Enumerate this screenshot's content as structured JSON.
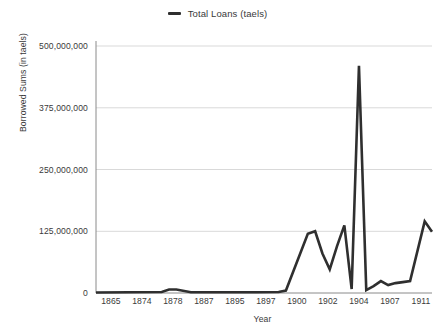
{
  "chart_data": {
    "type": "line",
    "title": "",
    "xlabel": "Year",
    "ylabel": "Borrowed Sums (in taels)",
    "ylim": [
      0,
      500000000
    ],
    "grid": true,
    "legend_position": "top-center",
    "legend": [
      "Total Loans (taels)"
    ],
    "y_ticks": [
      {
        "value": 0,
        "label": "0"
      },
      {
        "value": 125000000,
        "label": "125,000,000"
      },
      {
        "value": 250000000,
        "label": "250,000,000"
      },
      {
        "value": 375000000,
        "label": "375,000,000"
      },
      {
        "value": 500000000,
        "label": "500,000,000"
      }
    ],
    "x_tick_labels": [
      "1865",
      "1874",
      "1878",
      "1887",
      "1895",
      "1897",
      "1900",
      "1902",
      "1904",
      "1907",
      "1911"
    ],
    "categories": [
      "1865",
      "1874",
      "1875",
      "1876",
      "1878",
      "1887",
      "1890",
      "1891",
      "1894",
      "1895",
      "1896",
      "1897",
      "1898",
      "1899",
      "1900",
      "1901",
      "1902",
      "1903",
      "1904",
      "1905",
      "1906",
      "1907",
      "1908",
      "1910",
      "1911"
    ],
    "series": [
      {
        "name": "Total Loans (taels)",
        "color": "#2f2f2f",
        "values": [
          1000000,
          2000000,
          7000000,
          7000000,
          1500000,
          1500000,
          2000000,
          5000000,
          120000000,
          125000000,
          80000000,
          48000000,
          95000000,
          137000000,
          8000000,
          460000000,
          6000000,
          14000000,
          24000000,
          16000000,
          20000000,
          22000000,
          24000000,
          145000000,
          124000000
        ]
      }
    ],
    "annotations": []
  },
  "legend": {
    "items": [
      {
        "label": "Total Loans (taels)",
        "marker": "line-dash-marker",
        "color": "#2f2f2f"
      }
    ]
  },
  "axes": {
    "y_title": "Borrowed Sums (in taels)",
    "x_title": "Year"
  },
  "colors": {
    "line": "#2f2f2f",
    "grid": "#d9d9d9",
    "axis": "#595959",
    "text": "#3a3a3a",
    "background": "#ffffff"
  }
}
